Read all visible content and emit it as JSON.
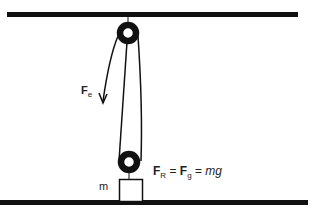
{
  "diagram": {
    "effort_label": {
      "symbol": "F",
      "subscript": "e"
    },
    "resistance_equation": {
      "lhs": {
        "symbol": "F",
        "subscript": "R"
      },
      "equals1": " = ",
      "mid": {
        "symbol": "F",
        "subscript": "g"
      },
      "equals2": " = ",
      "rhs": "mg"
    },
    "mass_label": "m",
    "colors": {
      "line": "#111111",
      "background": "#ffffff"
    }
  }
}
